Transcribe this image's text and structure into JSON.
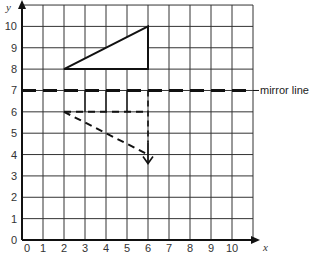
{
  "chart_data": {
    "type": "diagram",
    "title": "",
    "xlabel": "x",
    "ylabel": "y",
    "xlim": [
      0,
      11
    ],
    "ylim": [
      0,
      11
    ],
    "x_ticks": [
      "0",
      "1",
      "2",
      "3",
      "4",
      "5",
      "6",
      "7",
      "8",
      "9",
      "10"
    ],
    "y_ticks": [
      "0",
      "1",
      "2",
      "3",
      "4",
      "5",
      "6",
      "7",
      "8",
      "9",
      "10"
    ],
    "grid": true,
    "mirror_line": {
      "y": 7,
      "label": "mirror line",
      "style": "dashed"
    },
    "original_triangle": {
      "vertices": [
        [
          2,
          8
        ],
        [
          6,
          8
        ],
        [
          6,
          10
        ]
      ],
      "style": "solid"
    },
    "reflected_triangle_partial": {
      "vertices": [
        [
          2,
          6
        ],
        [
          6,
          6
        ],
        [
          6,
          4
        ]
      ],
      "style": "dashed",
      "construction_lines_x": [
        3,
        4,
        5
      ],
      "arrow_at": [
        6,
        4
      ]
    }
  },
  "labels": {
    "x_axis": "x",
    "y_axis": "y",
    "mirror_line": "mirror line",
    "origin": "0"
  },
  "colors": {
    "grid": "#333333",
    "lines": "#111111",
    "background": "#ffffff"
  }
}
